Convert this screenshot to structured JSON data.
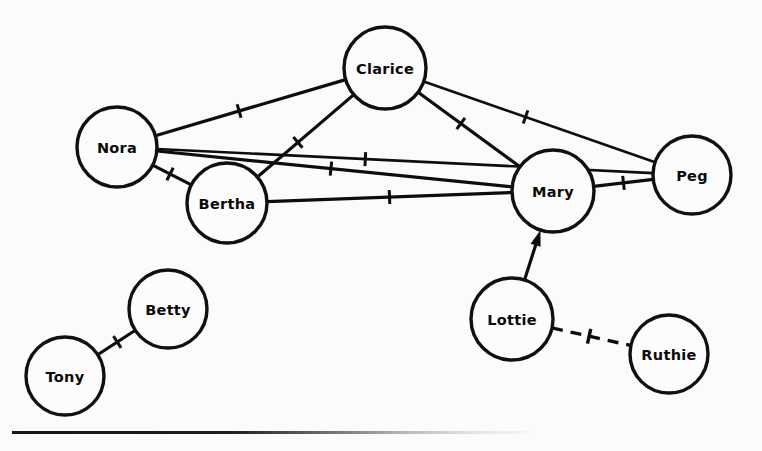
{
  "figure": {
    "kind": "sociogram",
    "background_color": "#fbfbfb",
    "ink_color": "#0d0d0d",
    "width": 762,
    "height": 451,
    "bottom_rule": {
      "name": "bottom-rule",
      "x": 12,
      "y": 431,
      "width": 520,
      "fades_right": true
    }
  },
  "nodes": [
    {
      "id": "clarice",
      "label": "Clarice",
      "cx": 385,
      "cy": 68,
      "r": 41
    },
    {
      "id": "nora",
      "label": "Nora",
      "cx": 117,
      "cy": 147,
      "r": 40
    },
    {
      "id": "bertha",
      "label": "Bertha",
      "cx": 227,
      "cy": 203,
      "r": 40
    },
    {
      "id": "mary",
      "label": "Mary",
      "cx": 553,
      "cy": 191,
      "r": 41
    },
    {
      "id": "peg",
      "label": "Peg",
      "cx": 692,
      "cy": 175,
      "r": 39
    },
    {
      "id": "betty",
      "label": "Betty",
      "cx": 168,
      "cy": 309,
      "r": 39
    },
    {
      "id": "tony",
      "label": "Tony",
      "cx": 65,
      "cy": 376,
      "r": 39
    },
    {
      "id": "lottie",
      "label": "Lottie",
      "cx": 512,
      "cy": 319,
      "r": 41
    },
    {
      "id": "ruthie",
      "label": "Ruthie",
      "cx": 669,
      "cy": 354,
      "r": 39
    }
  ],
  "edges": [
    {
      "id": "nora-clarice",
      "from": "nora",
      "to": "clarice",
      "style": "solid",
      "directed": false,
      "tick": "single",
      "tick_t": 0.44
    },
    {
      "id": "nora-peg",
      "from": "nora",
      "to": "peg",
      "style": "solid",
      "directed": false,
      "tick": "single",
      "tick_t": 0.42
    },
    {
      "id": "nora-mary",
      "from": "nora",
      "to": "mary",
      "style": "solid",
      "directed": false,
      "tick": "single",
      "tick_t": 0.49
    },
    {
      "id": "nora-bertha",
      "from": "nora",
      "to": "bertha",
      "style": "solid",
      "directed": false,
      "tick": "single",
      "tick_t": 0.45
    },
    {
      "id": "clarice-peg",
      "from": "clarice",
      "to": "peg",
      "style": "solid",
      "directed": false,
      "tick": "single",
      "tick_t": 0.44
    },
    {
      "id": "clarice-mary",
      "from": "clarice",
      "to": "mary",
      "style": "solid",
      "directed": false,
      "tick": "single",
      "tick_t": 0.42
    },
    {
      "id": "clarice-bertha",
      "from": "clarice",
      "to": "bertha",
      "style": "solid",
      "directed": false,
      "tick": "single",
      "tick_t": 0.58
    },
    {
      "id": "bertha-mary",
      "from": "bertha",
      "to": "mary",
      "style": "solid",
      "directed": false,
      "tick": "single",
      "tick_t": 0.5
    },
    {
      "id": "mary-peg",
      "from": "mary",
      "to": "peg",
      "style": "solid",
      "directed": false,
      "tick": "single",
      "tick_t": 0.5
    },
    {
      "id": "tony-betty",
      "from": "tony",
      "to": "betty",
      "style": "solid",
      "directed": false,
      "tick": "single",
      "tick_t": 0.52
    },
    {
      "id": "lottie-mary",
      "from": "lottie",
      "to": "mary",
      "style": "solid",
      "directed": true,
      "tick": "none",
      "tick_t": 0.5
    },
    {
      "id": "lottie-ruthie",
      "from": "lottie",
      "to": "ruthie",
      "style": "dashed",
      "directed": false,
      "tick": "cross",
      "tick_t": 0.47
    }
  ],
  "clusters": [
    {
      "name": "main-clique",
      "members": [
        "Nora",
        "Clarice",
        "Bertha",
        "Mary",
        "Peg"
      ]
    },
    {
      "name": "tony-betty-pair",
      "members": [
        "Tony",
        "Betty"
      ]
    },
    {
      "name": "lottie-ruthie-pair",
      "members": [
        "Lottie",
        "Ruthie"
      ]
    }
  ]
}
